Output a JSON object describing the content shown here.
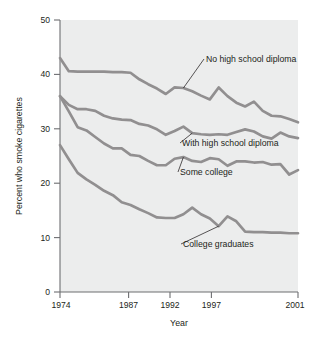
{
  "chart_data": {
    "type": "line",
    "title": "",
    "xlabel": "Year",
    "ylabel": "Percent who smoke cigarettes",
    "xlim": [
      1974,
      2001
    ],
    "ylim": [
      0,
      50
    ],
    "xticks": [
      1974,
      1987,
      1992,
      1997,
      2001
    ],
    "yticks": [
      0,
      10,
      20,
      30,
      40,
      50
    ],
    "grid": false,
    "legend": "inline-annotations",
    "line_color": "#918f90",
    "plot_background": "#eceded",
    "x": [
      1974,
      1975,
      1976,
      1977,
      1978,
      1979,
      1980,
      1981,
      1982,
      1983,
      1984,
      1985,
      1986,
      1987,
      1988,
      1989,
      1990,
      1991,
      1992,
      1993,
      1994,
      1995,
      1996,
      1997,
      1998,
      1999,
      2000,
      2001
    ],
    "series": [
      {
        "name": "No high school diploma",
        "values": [
          43.0,
          40.6,
          40.5,
          40.5,
          40.5,
          40.5,
          40.4,
          40.4,
          40.3,
          39.1,
          38.2,
          37.4,
          36.4,
          37.6,
          37.5,
          36.9,
          36.1,
          35.4,
          37.6,
          36.0,
          34.8,
          34.1,
          35.0,
          33.3,
          32.4,
          32.3,
          31.8,
          31.2
        ]
      },
      {
        "name": "With high school diploma",
        "values": [
          36.0,
          34.4,
          33.6,
          33.6,
          33.3,
          32.4,
          31.9,
          31.7,
          31.6,
          30.9,
          30.6,
          29.9,
          28.9,
          29.6,
          30.4,
          29.2,
          29.0,
          28.9,
          29.0,
          28.9,
          29.4,
          29.9,
          29.5,
          28.6,
          28.2,
          29.3,
          28.6,
          28.3
        ]
      },
      {
        "name": "Some college",
        "values": [
          36.0,
          33.2,
          30.3,
          29.7,
          28.5,
          27.3,
          26.4,
          26.4,
          25.2,
          25.0,
          24.1,
          23.3,
          23.3,
          24.5,
          24.8,
          24.1,
          23.9,
          24.6,
          24.4,
          23.2,
          24.0,
          24.0,
          23.8,
          23.9,
          23.4,
          23.5,
          21.6,
          22.4
        ]
      },
      {
        "name": "College graduates",
        "values": [
          27.0,
          24.4,
          21.9,
          20.7,
          19.7,
          18.6,
          17.8,
          16.5,
          16.0,
          15.2,
          14.5,
          13.7,
          13.6,
          13.6,
          14.3,
          15.5,
          14.3,
          13.5,
          12.1,
          13.9,
          13.0,
          11.1,
          11.0,
          11.0,
          10.9,
          10.9,
          10.8,
          10.8
        ]
      }
    ],
    "annotations": [
      {
        "text": "No high school diploma",
        "series": "No high school diploma"
      },
      {
        "text": "With high school diploma",
        "series": "With high school diploma"
      },
      {
        "text": "Some college",
        "series": "Some college"
      },
      {
        "text": "College graduates",
        "series": "College graduates"
      }
    ]
  }
}
